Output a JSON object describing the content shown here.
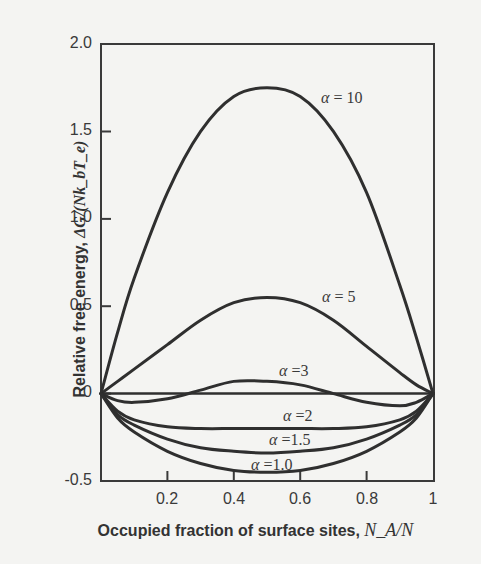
{
  "chart_data": {
    "type": "line",
    "title": "",
    "xlabel": "Occupied fraction of surface sites, N_A/N",
    "xlabel_text": "Occupied fraction of surface sites, ",
    "xlabel_math": "N_A/N",
    "ylabel": "Relative free energy, ΔG/(Nk_bT_e)",
    "ylabel_text": "Relative free energy, ",
    "ylabel_math": "ΔG/(Nk_bT_e)",
    "xlim": [
      0,
      1
    ],
    "ylim": [
      -0.5,
      2.0
    ],
    "x_ticks": [
      "0.2",
      "0.4",
      "0.6",
      "0.8",
      "1"
    ],
    "y_ticks": [
      "2.0",
      "1.5",
      "1.0",
      "0.5",
      "0",
      "-0.5"
    ],
    "grid": false,
    "legend": "inline curve labels",
    "x": [
      0,
      0.05,
      0.1,
      0.2,
      0.3,
      0.4,
      0.5,
      0.6,
      0.7,
      0.8,
      0.9,
      0.95,
      1.0
    ],
    "series": [
      {
        "name": "α = 10",
        "label": "α = 10",
        "values": [
          0,
          0.35,
          0.66,
          1.15,
          1.5,
          1.7,
          1.75,
          1.7,
          1.5,
          1.15,
          0.62,
          0.32,
          0
        ]
      },
      {
        "name": "α = 5",
        "label": "α = 5",
        "values": [
          0,
          0.07,
          0.14,
          0.28,
          0.42,
          0.52,
          0.55,
          0.52,
          0.42,
          0.27,
          0.12,
          0.05,
          0
        ]
      },
      {
        "name": "α = 3",
        "label": "α =3",
        "values": [
          0,
          -0.04,
          -0.05,
          -0.03,
          0.02,
          0.07,
          0.07,
          0.05,
          0.0,
          -0.05,
          -0.07,
          -0.05,
          0
        ]
      },
      {
        "name": "reference (0)",
        "label": "",
        "values": [
          0,
          0,
          0,
          0,
          0,
          0,
          0,
          0,
          0,
          0,
          0,
          0,
          0
        ]
      },
      {
        "name": "α = 2",
        "label": "α =2",
        "values": [
          0,
          -0.1,
          -0.15,
          -0.19,
          -0.2,
          -0.2,
          -0.2,
          -0.2,
          -0.2,
          -0.19,
          -0.15,
          -0.1,
          0
        ]
      },
      {
        "name": "α = 1.5",
        "label": "α =1.5",
        "values": [
          0,
          -0.12,
          -0.18,
          -0.26,
          -0.31,
          -0.33,
          -0.34,
          -0.33,
          -0.31,
          -0.26,
          -0.18,
          -0.12,
          0
        ]
      },
      {
        "name": "α = 1.0",
        "label": "α =1.0",
        "values": [
          0,
          -0.14,
          -0.22,
          -0.33,
          -0.4,
          -0.44,
          -0.45,
          -0.44,
          -0.4,
          -0.33,
          -0.22,
          -0.14,
          0
        ]
      }
    ]
  },
  "labels": {
    "a10": {
      "sym": "α",
      "rest": " = 10"
    },
    "a5": {
      "sym": "α",
      "rest": " = 5"
    },
    "a3": {
      "sym": "α",
      "rest": " =3"
    },
    "a2": {
      "sym": "α",
      "rest": " =2"
    },
    "a15": {
      "sym": "α",
      "rest": " =1.5"
    },
    "a1": {
      "sym": "α",
      "rest": " =1.0"
    }
  },
  "colors": {
    "background": "#f4f4f2",
    "line": "#2f2f2f",
    "text": "#3a3a3a"
  }
}
